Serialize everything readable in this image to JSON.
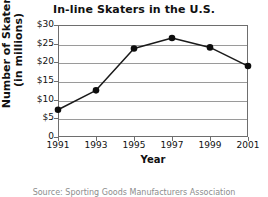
{
  "chart_data": {
    "type": "line",
    "title": "In-line Skaters in the U.S.",
    "xlabel": "Year",
    "ylabel_line1": "Number of Skaters",
    "ylabel_line2": "(in millions)",
    "x": [
      1991,
      1993,
      1995,
      1997,
      1999,
      2001
    ],
    "categories": [
      "1991",
      "1993",
      "1995",
      "1997",
      "1999",
      "2001"
    ],
    "values": [
      7.3,
      12.5,
      23.7,
      26.5,
      24.0,
      19.0
    ],
    "series": [
      {
        "name": "Number of Skaters (in millions)",
        "values": [
          7.3,
          12.5,
          23.7,
          26.5,
          24.0,
          19.0
        ]
      }
    ],
    "xlim": [
      1991,
      2001
    ],
    "ylim": [
      0,
      30
    ],
    "y_ticks": [
      0,
      5,
      10,
      15,
      20,
      25,
      30
    ],
    "y_tick_labels": [
      "0",
      "$5",
      "$10",
      "$15",
      "$20",
      "$25",
      "$30"
    ],
    "x_ticks": [
      1991,
      1993,
      1995,
      1997,
      1999,
      2001
    ],
    "x_tick_labels": [
      "1991",
      "1993",
      "1995",
      "1997",
      "1999",
      "2001"
    ],
    "grid": "horizontal",
    "legend": "none",
    "marker": "filled-circle",
    "line_color": "#1a1a1a",
    "marker_color": "#0d0d0d",
    "grid_color": "#9a9a9a",
    "frame_color": "#6e6e6e",
    "background": "#ffffff"
  },
  "source_note": "Source: Sporting Goods Manufacturers Association"
}
